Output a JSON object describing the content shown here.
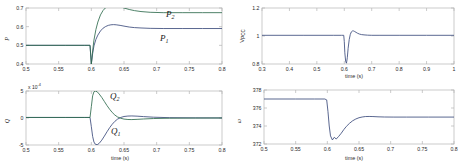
{
  "figure": {
    "background_color": "#ffffff",
    "axis_color": "#b5b5b5",
    "tick_color": "#2a2a2a",
    "series_colors": {
      "unit1": "#3c4c7c",
      "unit2": "#2f6b4e"
    }
  },
  "panels": {
    "power": {
      "ylabel": "P",
      "xlabel": "time (s)",
      "curve_labels": {
        "p1": "P",
        "p1_sub": "1",
        "p2": "P",
        "p2_sub": "2"
      }
    },
    "reactive": {
      "ylabel": "Q",
      "xlabel": "time (s)",
      "exponent_prefix": "x 10",
      "exponent_value": "-4",
      "curve_labels": {
        "q1": "Q",
        "q1_sub": "1",
        "q2": "Q",
        "q2_sub": "2"
      }
    },
    "voltage": {
      "ylabel": "V",
      "ylabel_sub": "PCC",
      "xlabel": "time (s)"
    },
    "frequency": {
      "ylabel": "ω",
      "xlabel": "time (s)"
    }
  },
  "chart_data": [
    {
      "type": "line",
      "id": "power",
      "title": "",
      "xlabel": "time (s)",
      "ylabel": "P",
      "xlim": [
        0.5,
        0.8
      ],
      "ylim": [
        0.4,
        0.7
      ],
      "xticks": [
        0.5,
        0.55,
        0.6,
        0.65,
        0.7,
        0.75,
        0.8
      ],
      "xticklabels": [
        "0.5",
        "0.55",
        "0.6",
        "0.65",
        "0.7",
        "0.75",
        "0.8"
      ],
      "yticks": [
        0.4,
        0.5,
        0.6,
        0.7
      ],
      "yticklabels": [
        "0.4",
        "0.5",
        "0.6",
        "0.7"
      ],
      "grid": false,
      "legend": "inline-annotations",
      "series": [
        {
          "name": "P_1",
          "color": "#3c4c7c",
          "x": [
            0.5,
            0.56,
            0.59,
            0.598,
            0.6,
            0.602,
            0.604,
            0.607,
            0.61,
            0.614,
            0.618,
            0.622,
            0.626,
            0.63,
            0.634,
            0.638,
            0.644,
            0.65,
            0.658,
            0.666,
            0.676,
            0.69,
            0.71,
            0.74,
            0.77,
            0.8
          ],
          "y": [
            0.5,
            0.5,
            0.5,
            0.5,
            0.4,
            0.455,
            0.497,
            0.532,
            0.555,
            0.577,
            0.592,
            0.601,
            0.607,
            0.61,
            0.611,
            0.61,
            0.607,
            0.603,
            0.598,
            0.595,
            0.593,
            0.591,
            0.59,
            0.59,
            0.59,
            0.59
          ]
        },
        {
          "name": "P_2",
          "color": "#2f6b4e",
          "x": [
            0.5,
            0.56,
            0.59,
            0.598,
            0.6,
            0.602,
            0.604,
            0.607,
            0.61,
            0.614,
            0.618,
            0.622,
            0.626,
            0.63,
            0.634,
            0.638,
            0.644,
            0.65,
            0.658,
            0.666,
            0.676,
            0.69,
            0.71,
            0.74,
            0.77,
            0.8
          ],
          "y": [
            0.5,
            0.5,
            0.5,
            0.5,
            0.4,
            0.47,
            0.528,
            0.585,
            0.625,
            0.663,
            0.687,
            0.702,
            0.711,
            0.715,
            0.715,
            0.713,
            0.707,
            0.7,
            0.692,
            0.686,
            0.681,
            0.677,
            0.675,
            0.675,
            0.675,
            0.675
          ]
        }
      ]
    },
    {
      "type": "line",
      "id": "reactive",
      "title": "",
      "xlabel": "time (s)",
      "ylabel": "Q",
      "y_exponent": -4,
      "xlim": [
        0.5,
        0.8
      ],
      "ylim": [
        -5,
        5
      ],
      "xticks": [
        0.5,
        0.55,
        0.6,
        0.65,
        0.7,
        0.75,
        0.8
      ],
      "xticklabels": [
        "0.5",
        "0.55",
        "0.6",
        "0.65",
        "0.7",
        "0.75",
        "0.8"
      ],
      "yticks": [
        -5,
        0,
        5
      ],
      "yticklabels": [
        "-5",
        "0",
        "5"
      ],
      "grid": false,
      "legend": "inline-annotations",
      "series": [
        {
          "name": "Q_1",
          "color": "#3c4c7c",
          "x": [
            0.5,
            0.56,
            0.59,
            0.598,
            0.6,
            0.602,
            0.604,
            0.606,
            0.609,
            0.612,
            0.616,
            0.62,
            0.624,
            0.628,
            0.632,
            0.636,
            0.64,
            0.645,
            0.65,
            0.656,
            0.662,
            0.67,
            0.68,
            0.695,
            0.72,
            0.76,
            0.8
          ],
          "y": [
            0.1,
            0.1,
            0.1,
            0.1,
            -1.6,
            -3.4,
            -4.45,
            -4.85,
            -4.95,
            -4.7,
            -4.1,
            -3.35,
            -2.55,
            -1.8,
            -1.15,
            -0.62,
            -0.22,
            0.1,
            0.28,
            0.36,
            0.38,
            0.34,
            0.26,
            0.15,
            0.06,
            0.02,
            0.01
          ]
        },
        {
          "name": "Q_2",
          "color": "#2f6b4e",
          "x": [
            0.5,
            0.56,
            0.59,
            0.598,
            0.6,
            0.602,
            0.604,
            0.606,
            0.609,
            0.612,
            0.616,
            0.62,
            0.624,
            0.628,
            0.632,
            0.636,
            0.64,
            0.645,
            0.65,
            0.656,
            0.662,
            0.67,
            0.68,
            0.695,
            0.72,
            0.76,
            0.8
          ],
          "y": [
            0.1,
            0.1,
            0.1,
            0.1,
            2.1,
            4.1,
            4.85,
            5.0,
            4.85,
            4.45,
            3.8,
            3.05,
            2.3,
            1.62,
            1.02,
            0.55,
            0.2,
            -0.05,
            -0.2,
            -0.28,
            -0.29,
            -0.25,
            -0.18,
            -0.1,
            -0.04,
            -0.01,
            0.0
          ]
        }
      ]
    },
    {
      "type": "line",
      "id": "voltage",
      "title": "",
      "xlabel": "time (s)",
      "ylabel": "V_PCC",
      "xlim": [
        0.3,
        1.0
      ],
      "ylim": [
        0.8,
        1.2
      ],
      "xticks": [
        0.3,
        0.4,
        0.5,
        0.6,
        0.7,
        0.8,
        0.9,
        1.0
      ],
      "xticklabels": [
        "0.3",
        "0.4",
        "0.5",
        "0.6",
        "0.7",
        "0.8",
        "0.9",
        "1"
      ],
      "yticks": [
        0.8,
        1.0,
        1.2
      ],
      "yticklabels": [
        "0.8",
        "1",
        "1.2"
      ],
      "grid": false,
      "legend": "none",
      "series": [
        {
          "name": "V_PCC",
          "color": "#3c4c7c",
          "x": [
            0.3,
            0.45,
            0.56,
            0.59,
            0.598,
            0.6,
            0.602,
            0.605,
            0.608,
            0.611,
            0.614,
            0.618,
            0.622,
            0.626,
            0.63,
            0.634,
            0.638,
            0.643,
            0.648,
            0.655,
            0.663,
            0.672,
            0.685,
            0.7,
            0.73,
            0.8,
            0.9,
            1.0
          ],
          "y": [
            1.005,
            1.005,
            1.005,
            1.005,
            1.005,
            0.96,
            0.88,
            0.818,
            0.806,
            0.845,
            0.912,
            0.975,
            1.012,
            1.03,
            1.036,
            1.036,
            1.032,
            1.026,
            1.02,
            1.014,
            1.01,
            1.008,
            1.006,
            1.005,
            1.005,
            1.005,
            1.005,
            1.005
          ]
        }
      ]
    },
    {
      "type": "line",
      "id": "frequency",
      "title": "",
      "xlabel": "time (s)",
      "ylabel": "ω",
      "xlim": [
        0.5,
        0.8
      ],
      "ylim": [
        372,
        378
      ],
      "xticks": [
        0.5,
        0.55,
        0.6,
        0.65,
        0.7,
        0.75,
        0.8
      ],
      "xticklabels": [
        "0.5",
        "0.55",
        "0.6",
        "0.65",
        "0.7",
        "0.75",
        "0.8"
      ],
      "yticks": [
        372,
        374,
        376,
        378
      ],
      "yticklabels": [
        "372",
        "374",
        "376",
        "378"
      ],
      "grid": false,
      "legend": "none",
      "series": [
        {
          "name": "omega",
          "color": "#3c4c7c",
          "x": [
            0.5,
            0.55,
            0.58,
            0.596,
            0.599,
            0.601,
            0.603,
            0.605,
            0.608,
            0.611,
            0.614,
            0.618,
            0.622,
            0.626,
            0.63,
            0.635,
            0.64,
            0.645,
            0.65,
            0.655,
            0.66,
            0.666,
            0.672,
            0.68,
            0.69,
            0.705,
            0.725,
            0.76,
            0.8
          ],
          "y": [
            377.0,
            377.0,
            377.0,
            377.0,
            376.9,
            375.6,
            374.0,
            372.9,
            372.45,
            372.75,
            372.55,
            372.85,
            373.2,
            373.6,
            373.95,
            374.3,
            374.58,
            374.78,
            374.92,
            375.0,
            375.05,
            375.06,
            375.05,
            375.02,
            375.0,
            374.99,
            374.99,
            374.99,
            374.99
          ]
        }
      ]
    }
  ]
}
